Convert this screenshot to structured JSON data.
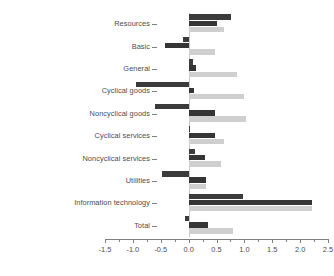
{
  "chart_data": {
    "type": "bar",
    "title": "",
    "subtitle": "",
    "xlabel": "",
    "ylabel": "",
    "orientation": "horizontal",
    "grid": false,
    "legend": "none",
    "xlim": [
      -1.5,
      2.5
    ],
    "xticks": [
      -1.5,
      -1.0,
      -0.5,
      0.0,
      0.5,
      1.0,
      1.5,
      2.0,
      2.5
    ],
    "xtick_labels": [
      "-1.5",
      "-1.0",
      "-0.5",
      "0.0",
      "0.5",
      "1.0",
      "1.5",
      "2.0",
      "2.5"
    ],
    "minor_ticks": [
      -1.25,
      -0.75,
      -0.25,
      0.25,
      0.75,
      1.25,
      1.75,
      2.25
    ],
    "categories": [
      "Resources",
      "Basic",
      "General",
      "Cyclical goods",
      "Noncyclical goods",
      "Cyclical services",
      "Noncyclical services",
      "Utilities",
      "Information technology",
      "Total"
    ],
    "series": [
      {
        "name": "series-1",
        "color": "#3b3b3b",
        "values": [
          0.76,
          -0.1,
          0.08,
          -0.95,
          -0.6,
          0.02,
          0.11,
          -0.47,
          0.97,
          -0.07
        ]
      },
      {
        "name": "series-2",
        "color": "#353535",
        "values": [
          0.51,
          -0.42,
          0.13,
          0.1,
          0.48,
          0.48,
          0.29,
          0.32,
          2.22,
          0.35
        ]
      },
      {
        "name": "series-3",
        "color": "#cfcfcf",
        "values": [
          0.63,
          0.48,
          0.87,
          1.0,
          1.03,
          0.64,
          0.58,
          0.31,
          2.22,
          0.8
        ]
      }
    ]
  },
  "colors": {
    "background": "#ffffff",
    "axis": "#808080",
    "text": "#4d4d4d",
    "zero_line": "#c9c9c9"
  }
}
